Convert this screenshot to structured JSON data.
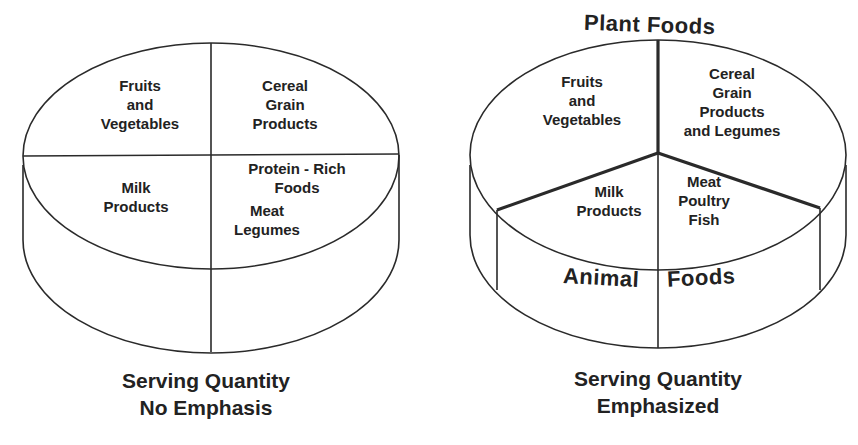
{
  "left_pie": {
    "name": "Serving Quantity No Emphasis",
    "segments": [
      {
        "lines": [
          "Fruits",
          "and",
          "Vegetables"
        ]
      },
      {
        "lines": [
          "Cereal",
          "Grain",
          "Products"
        ]
      },
      {
        "lines": [
          "Milk",
          "Products"
        ]
      },
      {
        "lines": [
          "Protein - Rich",
          "Foods"
        ]
      },
      {
        "lines": [
          "Meat",
          "Legumes"
        ]
      }
    ],
    "caption": [
      "Serving Quantity",
      "No Emphasis"
    ]
  },
  "right_pie": {
    "name": "Serving Quantity Emphasized",
    "top_label": "Plant Foods",
    "bottom_label_left": "Animal",
    "bottom_label_right": "Foods",
    "segments": [
      {
        "lines": [
          "Fruits",
          "and",
          "Vegetables"
        ]
      },
      {
        "lines": [
          "Cereal",
          "Grain",
          "Products",
          "and Legumes"
        ]
      },
      {
        "lines": [
          "Milk",
          "Products"
        ]
      },
      {
        "lines": [
          "Meat",
          "Poultry",
          "Fish"
        ]
      }
    ],
    "caption": [
      "Serving Quantity",
      "Emphasized"
    ]
  },
  "colors": {
    "line": "#2a2a2a",
    "background": "#ffffff",
    "text": "#222222"
  }
}
